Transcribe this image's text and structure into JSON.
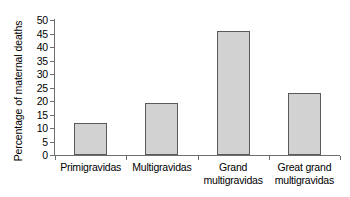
{
  "chart_data": {
    "type": "bar",
    "title": "",
    "xlabel": "",
    "ylabel": "Percentage of maternal deaths",
    "categories": [
      "Primigravidas",
      "Multigravidas",
      "Grand multigravidas",
      "Great grand multigravidas"
    ],
    "category_lines": [
      [
        "Primigravidas"
      ],
      [
        "Multigravidas"
      ],
      [
        "Grand",
        "multigravidas"
      ],
      [
        "Great grand",
        "multigravidas"
      ]
    ],
    "values": [
      11.8,
      19.2,
      46.0,
      22.8
    ],
    "ylim": [
      0,
      50
    ],
    "ytick_step": 5,
    "yticks": [
      50,
      45,
      40,
      35,
      30,
      25,
      20,
      15,
      10,
      5,
      0
    ],
    "grid": false,
    "legend": "none",
    "bar_fill_color": "#d2d2d2",
    "bar_border_color": "#5a5a5a",
    "axis_color": "#6e6e6e",
    "background_color": "#ffffff"
  }
}
